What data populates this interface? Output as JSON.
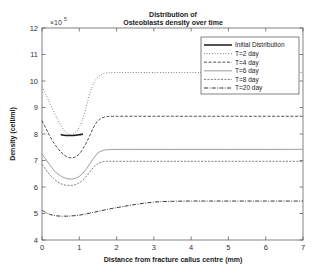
{
  "figure": {
    "title_line1": "Distribution of",
    "title_line2": "Osteoblasts density over time",
    "exponent_prefix": "×10",
    "exponent_power": "5"
  },
  "axes": {
    "xlabel": "Distance from fracture callus centre (mm)",
    "ylabel": "Density (cell/ml)",
    "xticks": [
      "0",
      "1",
      "2",
      "3",
      "4",
      "5",
      "6",
      "7"
    ],
    "yticks": [
      "4",
      "5",
      "6",
      "7",
      "8",
      "9",
      "10",
      "11",
      "12"
    ]
  },
  "legend": {
    "items": [
      {
        "label": "Initial Distribution",
        "style": "solid"
      },
      {
        "label": "T=2 day",
        "style": "dotted"
      },
      {
        "label": "T=4 day",
        "style": "dashed"
      },
      {
        "label": "T=6 day",
        "style": "solid-light"
      },
      {
        "label": "T=8 day",
        "style": "dash-fine"
      },
      {
        "label": "T=20 day",
        "style": "dashdot"
      }
    ]
  },
  "chart_data": {
    "type": "line",
    "title": "Distribution of Osteoblasts density over time",
    "xlabel": "Distance from fracture callus centre (mm)",
    "ylabel": "Density (cell/ml)",
    "y_exponent": 100000,
    "xlim": [
      0,
      7
    ],
    "ylim": [
      4,
      12
    ],
    "grid": false,
    "legend_position": "upper right",
    "x": [
      0,
      0.1,
      0.2,
      0.3,
      0.4,
      0.5,
      0.6,
      0.7,
      0.8,
      0.9,
      1.0,
      1.1,
      1.2,
      1.3,
      1.4,
      1.5,
      1.6,
      1.7,
      1.8,
      2.0,
      2.5,
      3.0,
      3.5,
      4.0,
      4.5,
      5.0,
      5.5,
      6.0,
      6.5,
      7.0
    ],
    "series": [
      {
        "name": "Initial Distribution",
        "style": "solid",
        "color": "#1a1a1a",
        "values": [
          null,
          null,
          null,
          null,
          null,
          7.98,
          7.95,
          7.94,
          7.94,
          7.95,
          7.97,
          8.0,
          null,
          null,
          null,
          null,
          null,
          null,
          null,
          null,
          null,
          null,
          null,
          null,
          null,
          null,
          null,
          null,
          null,
          null
        ]
      },
      {
        "name": "T=2 day",
        "style": "dotted",
        "color": "#3d3d3d",
        "values": [
          9.78,
          9.5,
          9.2,
          8.9,
          8.6,
          8.33,
          8.12,
          8.0,
          7.97,
          8.05,
          8.25,
          8.6,
          9.1,
          9.6,
          9.95,
          10.15,
          10.25,
          10.3,
          10.31,
          10.32,
          10.32,
          10.32,
          10.32,
          10.32,
          10.32,
          10.32,
          10.32,
          10.32,
          10.32,
          10.32
        ]
      },
      {
        "name": "T=4 day",
        "style": "dashed",
        "color": "#3d3d3d",
        "values": [
          8.5,
          8.22,
          7.95,
          7.7,
          7.5,
          7.33,
          7.2,
          7.12,
          7.1,
          7.14,
          7.25,
          7.45,
          7.7,
          8.0,
          8.3,
          8.5,
          8.6,
          8.65,
          8.66,
          8.67,
          8.67,
          8.67,
          8.67,
          8.67,
          8.67,
          8.67,
          8.67,
          8.67,
          8.67,
          8.67
        ]
      },
      {
        "name": "T=6 day",
        "style": "solid-light",
        "color": "#9a9a9a",
        "values": [
          7.25,
          7.05,
          6.85,
          6.67,
          6.52,
          6.42,
          6.35,
          6.31,
          6.3,
          6.33,
          6.4,
          6.53,
          6.7,
          6.92,
          7.12,
          7.28,
          7.36,
          7.4,
          7.41,
          7.42,
          7.42,
          7.42,
          7.42,
          7.42,
          7.42,
          7.42,
          7.42,
          7.42,
          7.42,
          7.42
        ]
      },
      {
        "name": "T=8 day",
        "style": "dash-fine",
        "color": "#6e6e6e",
        "values": [
          6.85,
          6.66,
          6.48,
          6.33,
          6.21,
          6.13,
          6.08,
          6.06,
          6.06,
          6.09,
          6.16,
          6.27,
          6.42,
          6.6,
          6.77,
          6.88,
          6.94,
          6.97,
          6.97,
          6.97,
          6.97,
          6.97,
          6.97,
          6.97,
          6.97,
          6.97,
          6.97,
          6.97,
          6.97,
          6.97
        ]
      },
      {
        "name": "T=20 day",
        "style": "dashdot",
        "color": "#2b2b2b",
        "values": [
          5.12,
          5.04,
          4.97,
          4.93,
          4.91,
          4.9,
          4.9,
          4.9,
          4.91,
          4.92,
          4.94,
          4.96,
          4.99,
          5.02,
          5.05,
          5.08,
          5.11,
          5.14,
          5.17,
          5.22,
          5.34,
          5.43,
          5.46,
          5.47,
          5.47,
          5.47,
          5.47,
          5.47,
          5.47,
          5.47
        ]
      }
    ]
  }
}
